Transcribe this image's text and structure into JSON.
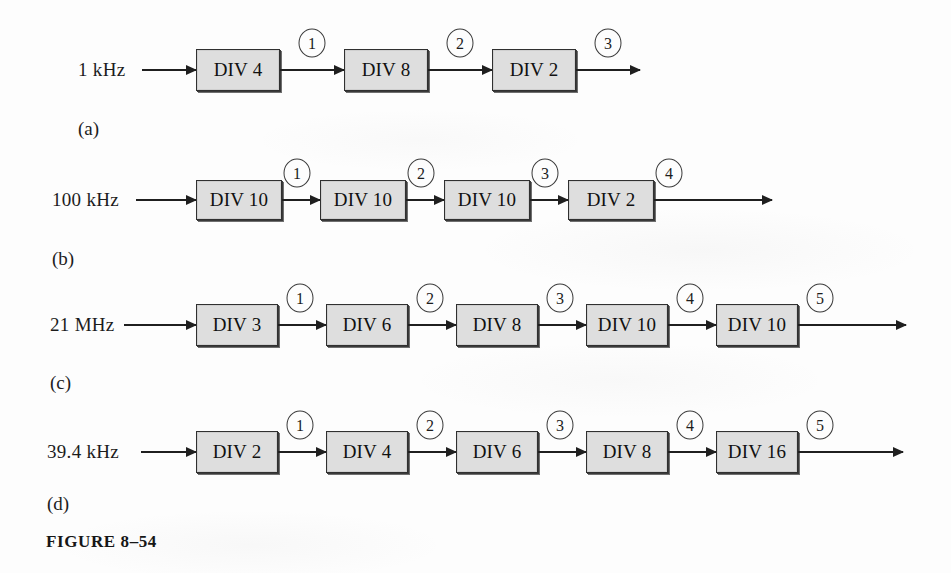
{
  "figure": {
    "caption": "FIGURE 8–54",
    "caption_x": 46,
    "caption_y": 532
  },
  "rows": [
    {
      "id": "a",
      "part_label": "(a)",
      "part_label_x": 78,
      "part_label_y": 118,
      "input_label": "1 kHz",
      "input_label_x": 78,
      "axis_y": 70,
      "box_w": 84,
      "box_h": 42,
      "box_x": [
        196,
        344,
        492
      ],
      "boxes": [
        "DIV 4",
        "DIV 8",
        "DIV 2"
      ],
      "markers": [
        "1",
        "2",
        "3"
      ],
      "marker_x": [
        312,
        460,
        608
      ],
      "end_x": 640
    },
    {
      "id": "b",
      "part_label": "(b)",
      "part_label_x": 52,
      "part_label_y": 248,
      "input_label": "100 kHz",
      "input_label_x": 52,
      "axis_y": 200,
      "box_w": 86,
      "box_h": 40,
      "box_x": [
        196,
        320,
        444,
        568
      ],
      "boxes": [
        "DIV 10",
        "DIV 10",
        "DIV 10",
        "DIV 2"
      ],
      "markers": [
        "1",
        "2",
        "3",
        "4"
      ],
      "marker_x": [
        297,
        421,
        545,
        669
      ],
      "end_x": 772
    },
    {
      "id": "c",
      "part_label": "(c)",
      "part_label_x": 50,
      "part_label_y": 372,
      "input_label": "21 MHz",
      "input_label_x": 50,
      "axis_y": 325,
      "box_w": 82,
      "box_h": 42,
      "box_x": [
        196,
        326,
        456,
        586,
        716
      ],
      "boxes": [
        "DIV 3",
        "DIV 6",
        "DIV 8",
        "DIV 10",
        "DIV 10"
      ],
      "markers": [
        "1",
        "2",
        "3",
        "4",
        "5"
      ],
      "marker_x": [
        300,
        430,
        560,
        690,
        820
      ],
      "end_x": 906
    },
    {
      "id": "d",
      "part_label": "(d)",
      "part_label_x": 47,
      "part_label_y": 493,
      "input_label": "39.4 kHz",
      "input_label_x": 47,
      "axis_y": 452,
      "box_w": 82,
      "box_h": 42,
      "box_x": [
        196,
        326,
        456,
        586,
        716
      ],
      "boxes": [
        "DIV 2",
        "DIV 4",
        "DIV 6",
        "DIV 8",
        "DIV 16"
      ],
      "markers": [
        "1",
        "2",
        "3",
        "4",
        "5"
      ],
      "marker_x": [
        300,
        430,
        560,
        690,
        820
      ],
      "end_x": 903
    }
  ],
  "colors": {
    "box_fill": "#dedede",
    "box_border": "#303030",
    "line": "#1f1f1f",
    "text": "#1c1c1c",
    "page": "#fdfdfd"
  }
}
